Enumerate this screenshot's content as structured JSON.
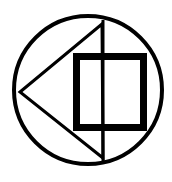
{
  "diagram": {
    "type": "geometric-symbol",
    "background": "#ffffff",
    "stroke_color": "#000000",
    "elements": [
      {
        "shape": "circle",
        "cx": 88,
        "cy": 90,
        "r": 74,
        "stroke_width": 4
      },
      {
        "shape": "triangle",
        "points": [
          [
            20,
            92
          ],
          [
            102,
            24
          ],
          [
            103,
            158
          ]
        ],
        "stroke_width": 3
      },
      {
        "shape": "vertical-line",
        "x": 103,
        "y1": 20,
        "y2": 164,
        "stroke_width": 3
      },
      {
        "shape": "square",
        "x": 76,
        "y": 57,
        "width": 68,
        "height": 71,
        "stroke_width": 7
      }
    ]
  }
}
